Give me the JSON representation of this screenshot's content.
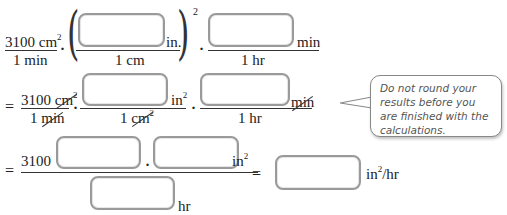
{
  "row1": {
    "frac1": {
      "num": "3100 cm",
      "num_exp": "2",
      "den": "1 min"
    },
    "dot": "·",
    "paren_frac": {
      "num_unit": "in.",
      "den": "1 cm",
      "exponent": "2"
    },
    "frac3": {
      "num_unit": "min",
      "den": "1 hr"
    }
  },
  "row2": {
    "equals": "=",
    "frac1": {
      "num_value": "3100",
      "num_unit": "cm",
      "num_exp": "2",
      "den_value": "1",
      "den_unit": "min"
    },
    "frac2": {
      "num_unit": "in",
      "num_exp": "2",
      "den_value": "1",
      "den_unit": "cm",
      "den_exp": "2"
    },
    "frac3": {
      "num_unit": "min",
      "den": "1 hr"
    }
  },
  "row3": {
    "equals": "=",
    "num_prefix": "3100 ·",
    "num_unit": "in",
    "num_exp": "2",
    "den_unit": "hr",
    "equals2": "=",
    "result_unit": "in",
    "result_exp": "2",
    "result_suffix": "/hr"
  },
  "callout": {
    "text": "Do not round your results before you are finished with the calculations."
  },
  "inputs": {
    "box1": "",
    "box2": "",
    "box3": "",
    "box4": "",
    "box5": "",
    "box6": "",
    "box7": "",
    "box8": ""
  }
}
